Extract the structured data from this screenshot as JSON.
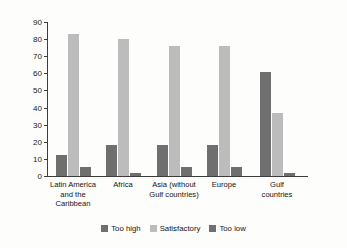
{
  "chart_data": {
    "type": "bar",
    "title": "",
    "subtitle": "",
    "xlabel": "",
    "ylabel": "Share of respondents (%)",
    "ylim": [
      0,
      90
    ],
    "yticks": [
      0,
      10,
      20,
      30,
      40,
      50,
      60,
      70,
      80,
      90
    ],
    "grid": false,
    "legend_position": "bottom-center",
    "categories": [
      "Latin America\nand the\nCaribbean",
      "Africa",
      "Asia (without\nGulf countries)",
      "Europe",
      "Gulf\ncountries"
    ],
    "series": [
      {
        "name": "Too high",
        "color": "#6f6f6f",
        "values": [
          12,
          18,
          18,
          18,
          61
        ]
      },
      {
        "name": "Satisfactory",
        "color": "#bcbcbc",
        "values": [
          83,
          80,
          76,
          76,
          37
        ]
      },
      {
        "name": "Too low",
        "color": "#6f6f6f",
        "values": [
          5,
          2,
          5,
          5,
          2
        ]
      }
    ]
  },
  "legend": {
    "items": [
      {
        "label": "Too high",
        "color": "#6f6f6f"
      },
      {
        "label": "Satisfactory",
        "color": "#bcbcbc"
      },
      {
        "label": "Too low",
        "color": "#6f6f6f"
      }
    ]
  }
}
